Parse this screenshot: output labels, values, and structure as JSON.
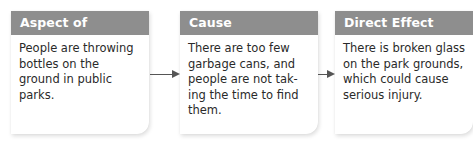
{
  "diagram": {
    "boxes": [
      {
        "title": "Aspect of Problem",
        "text": "People are throwing bottles on the ground in public parks."
      },
      {
        "title": "Cause",
        "text": "There are too few garbage cans, and people are not tak-ing the time to find them."
      },
      {
        "title": "Direct Effect",
        "text": "There is broken glass on the park grounds, which could cause serious injury."
      }
    ],
    "arrows": [
      {
        "from": "Aspect of Problem",
        "to": "Cause"
      },
      {
        "from": "Cause",
        "to": "Direct Effect"
      }
    ],
    "colors": {
      "header_bg": "#8e8e8e",
      "header_text": "#ffffff",
      "arrow": "#555555"
    }
  }
}
